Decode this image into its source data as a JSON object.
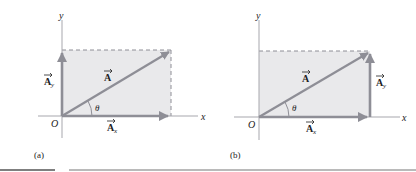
{
  "colors": {
    "fill": "#e9e9eb",
    "vector": "#8e8e96",
    "axis": "#a7a7ad",
    "dash": "#8e8e96",
    "text": "#222222",
    "rule": "#555555"
  },
  "panels": [
    {
      "id": "a",
      "caption": "(a)",
      "axis_x_label": "x",
      "axis_y_label": "y",
      "origin_label": "O",
      "vector_label": "A",
      "x_component_label": "A",
      "x_component_sub": "x",
      "y_component_label": "A",
      "y_component_sub": "y",
      "angle_label": "θ",
      "y_component_position": "left (along y-axis)"
    },
    {
      "id": "b",
      "caption": "(b)",
      "axis_x_label": "x",
      "axis_y_label": "y",
      "origin_label": "O",
      "vector_label": "A",
      "x_component_label": "A",
      "x_component_sub": "x",
      "y_component_label": "A",
      "y_component_sub": "y",
      "angle_label": "θ",
      "y_component_position": "right (tip-to-tail)"
    }
  ]
}
